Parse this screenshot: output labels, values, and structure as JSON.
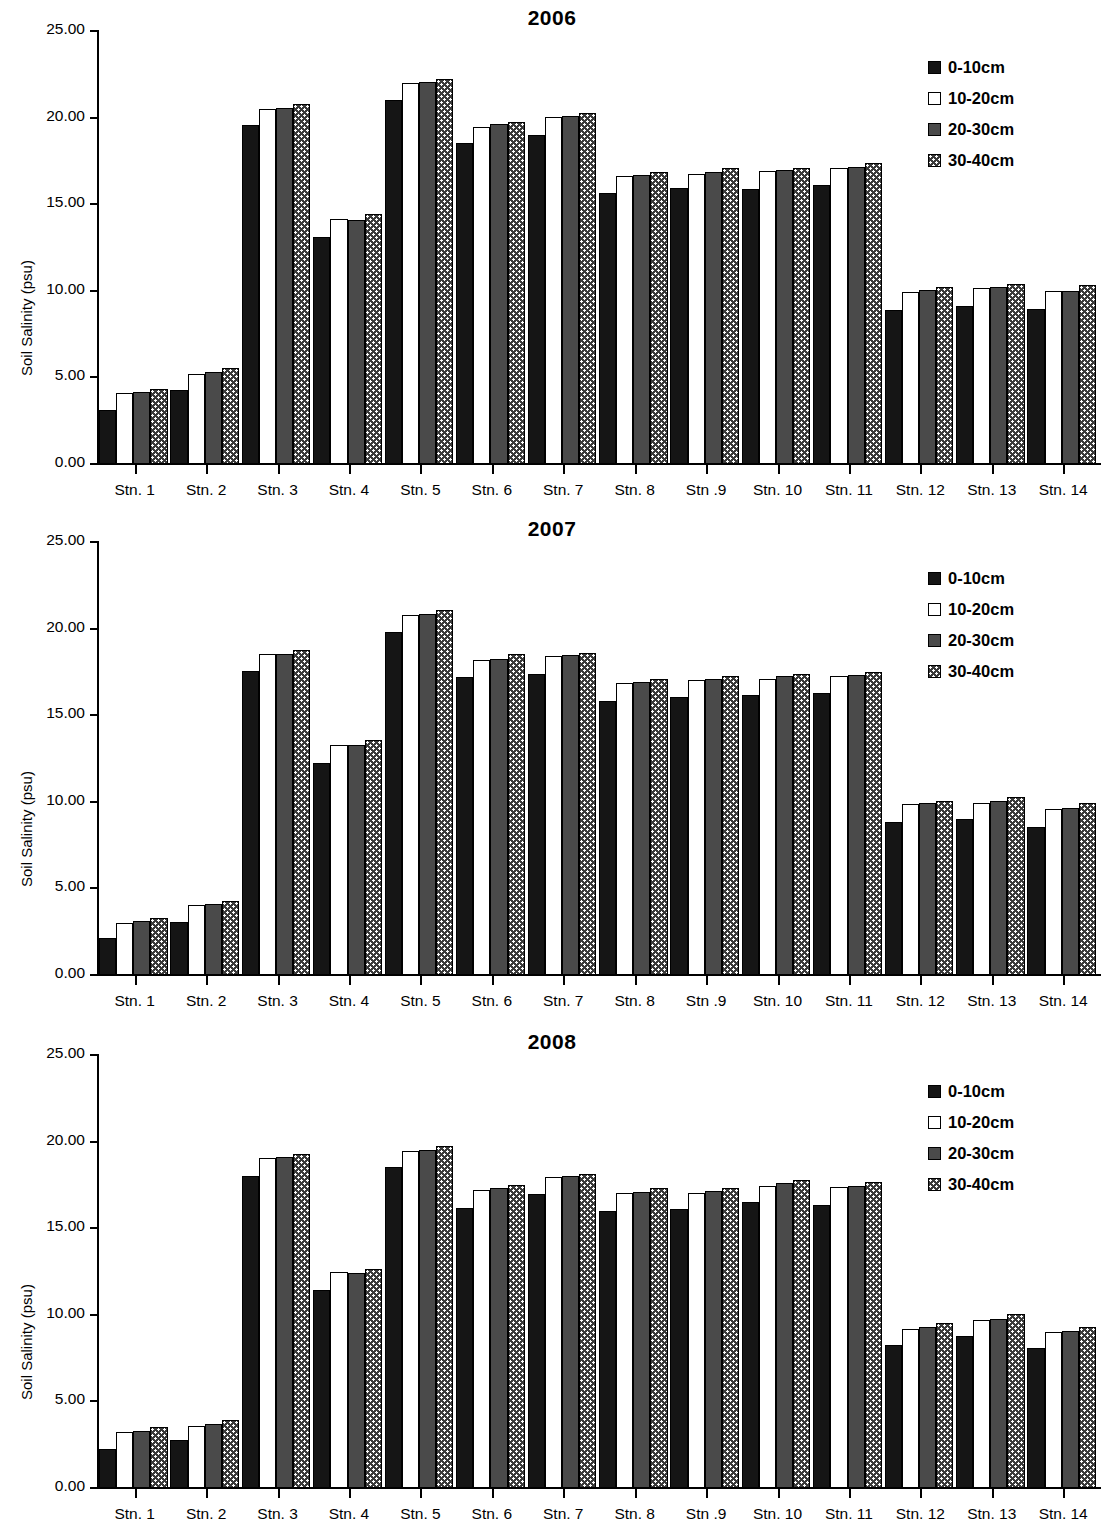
{
  "figure": {
    "ylabel": "Soil Salinity (psu)",
    "y_ticks": [
      "0.00",
      "5.00",
      "10.00",
      "15.00",
      "20.00",
      "25.00"
    ],
    "categories": [
      "Stn. 1",
      "Stn. 2",
      "Stn. 3",
      "Stn. 4",
      "Stn. 5",
      "Stn. 6",
      "Stn. 7",
      "Stn. 8",
      "Stn .9",
      "Stn. 10",
      "Stn. 11",
      "Stn. 12",
      "Stn. 13",
      "Stn. 14"
    ],
    "legend": [
      {
        "label": "0-10cm",
        "swatch": "solid-black-swatch",
        "color": "#151515"
      },
      {
        "label": "10-20cm",
        "swatch": "open-white-swatch",
        "color": "#ffffff"
      },
      {
        "label": "20-30cm",
        "swatch": "dark-gray-swatch",
        "color": "#4a4a4a"
      },
      {
        "label": "30-40cm",
        "swatch": "checkered-swatch",
        "color": "#3a3a3a"
      }
    ]
  },
  "panels": [
    {
      "title": "2006"
    },
    {
      "title": "2007"
    },
    {
      "title": "2008"
    }
  ],
  "chart_data": [
    {
      "type": "bar",
      "title": "2006",
      "xlabel": "",
      "ylabel": "Soil Salinity (psu)",
      "ylim": [
        0,
        25
      ],
      "ytick_step": 5,
      "grid": false,
      "legend_position": "top-right",
      "categories": [
        "Stn. 1",
        "Stn. 2",
        "Stn. 3",
        "Stn. 4",
        "Stn. 5",
        "Stn. 6",
        "Stn. 7",
        "Stn. 8",
        "Stn .9",
        "Stn. 10",
        "Stn. 11",
        "Stn. 12",
        "Stn. 13",
        "Stn. 14"
      ],
      "series": [
        {
          "name": "0-10cm",
          "values": [
            3.05,
            4.2,
            19.5,
            13.05,
            20.95,
            18.45,
            18.95,
            15.6,
            15.85,
            15.8,
            16.05,
            8.85,
            9.05,
            8.9
          ]
        },
        {
          "name": "10-20cm",
          "values": [
            4.05,
            5.15,
            20.45,
            14.1,
            21.95,
            19.4,
            20.0,
            16.6,
            16.7,
            16.85,
            17.05,
            9.85,
            10.1,
            9.95
          ]
        },
        {
          "name": "20-30cm",
          "values": [
            4.1,
            5.25,
            20.5,
            14.05,
            22.0,
            19.55,
            20.05,
            16.65,
            16.8,
            16.9,
            17.1,
            10.0,
            10.15,
            9.95
          ]
        },
        {
          "name": "30-40cm",
          "values": [
            4.25,
            5.5,
            20.7,
            14.4,
            22.15,
            19.7,
            20.2,
            16.8,
            17.05,
            17.05,
            17.3,
            10.15,
            10.35,
            10.25
          ]
        }
      ]
    },
    {
      "type": "bar",
      "title": "2007",
      "xlabel": "",
      "ylabel": "Soil Salinity (psu)",
      "ylim": [
        0,
        25
      ],
      "ytick_step": 5,
      "grid": false,
      "legend_position": "top-right",
      "categories": [
        "Stn. 1",
        "Stn. 2",
        "Stn. 3",
        "Stn. 4",
        "Stn. 5",
        "Stn. 6",
        "Stn. 7",
        "Stn. 8",
        "Stn .9",
        "Stn. 10",
        "Stn. 11",
        "Stn. 12",
        "Stn. 13",
        "Stn. 14"
      ],
      "series": [
        {
          "name": "0-10cm",
          "values": [
            2.1,
            3.0,
            17.5,
            12.2,
            19.75,
            17.15,
            17.35,
            15.75,
            16.0,
            16.1,
            16.2,
            8.75,
            8.95,
            8.5
          ]
        },
        {
          "name": "10-20cm",
          "values": [
            2.95,
            4.0,
            18.45,
            13.2,
            20.75,
            18.15,
            18.35,
            16.8,
            16.95,
            17.05,
            17.2,
            9.8,
            9.9,
            9.55
          ]
        },
        {
          "name": "20-30cm",
          "values": [
            3.05,
            4.05,
            18.5,
            13.25,
            20.8,
            18.2,
            18.4,
            16.85,
            17.05,
            17.2,
            17.25,
            9.85,
            10.0,
            9.6
          ]
        },
        {
          "name": "30-40cm",
          "values": [
            3.25,
            4.2,
            18.7,
            13.5,
            21.0,
            18.45,
            18.55,
            17.05,
            17.2,
            17.35,
            17.45,
            10.0,
            10.2,
            9.85
          ]
        }
      ]
    },
    {
      "type": "bar",
      "title": "2008",
      "xlabel": "",
      "ylabel": "Soil Salinity (psu)",
      "ylim": [
        0,
        25
      ],
      "ytick_step": 5,
      "grid": false,
      "legend_position": "top-right",
      "categories": [
        "Stn. 1",
        "Stn. 2",
        "Stn. 3",
        "Stn. 4",
        "Stn. 5",
        "Stn. 6",
        "Stn. 7",
        "Stn. 8",
        "Stn .9",
        "Stn. 10",
        "Stn. 11",
        "Stn. 12",
        "Stn. 13",
        "Stn. 14"
      ],
      "series": [
        {
          "name": "0-10cm",
          "values": [
            2.2,
            2.7,
            17.95,
            11.35,
            18.45,
            16.1,
            16.9,
            15.95,
            16.05,
            16.45,
            16.3,
            8.2,
            8.7,
            8.0
          ]
        },
        {
          "name": "10-20cm",
          "values": [
            3.2,
            3.55,
            19.0,
            12.4,
            19.4,
            17.15,
            17.9,
            16.95,
            17.0,
            17.4,
            17.35,
            9.15,
            9.65,
            8.95
          ]
        },
        {
          "name": "20-30cm",
          "values": [
            3.25,
            3.65,
            19.05,
            12.35,
            19.45,
            17.25,
            17.95,
            17.05,
            17.1,
            17.55,
            17.4,
            9.25,
            9.7,
            9.0
          ]
        },
        {
          "name": "30-40cm",
          "values": [
            3.45,
            3.85,
            19.2,
            12.6,
            19.7,
            17.45,
            18.1,
            17.25,
            17.25,
            17.7,
            17.6,
            9.45,
            10.0,
            9.25
          ]
        }
      ]
    }
  ]
}
